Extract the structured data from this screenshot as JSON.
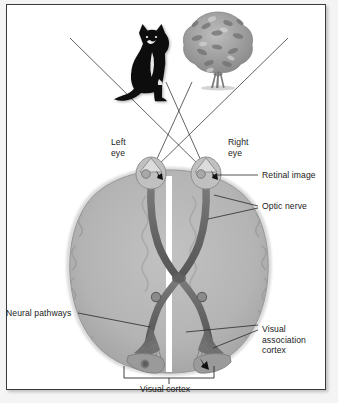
{
  "figure": {
    "type": "anatomical-diagram",
    "background_color": "#ffffff",
    "frame_color": "#3a3a3a",
    "brain_fill": "#b3b3b3",
    "brain_outline": "#8f8f8f",
    "nerve_color": "#6e6e6e",
    "line_color": "#2a2a2a"
  },
  "stimuli": [
    {
      "name": "cat",
      "label": "cat-silhouette",
      "x": 142,
      "y": 57
    },
    {
      "name": "bush",
      "label": "bush-shrub",
      "x": 216,
      "y": 52
    }
  ],
  "labels": {
    "left_eye": "Left\neye",
    "right_eye": "Right\neye",
    "retinal_image": "Retinal image",
    "optic_nerve": "Optic nerve",
    "neural_pathways": "Neural pathways",
    "visual_association_cortex": "Visual\nassociation\ncortex",
    "visual_cortex": "Visual cortex"
  },
  "structures": [
    {
      "name": "left-eye",
      "description": "Left eyeball with inverted retinal image"
    },
    {
      "name": "right-eye",
      "description": "Right eyeball with inverted retinal image"
    },
    {
      "name": "optic-chiasm",
      "description": "X-shaped crossing of optic nerves"
    },
    {
      "name": "lateral-geniculate-nucleus",
      "description": "Relay bump on optic tract"
    },
    {
      "name": "optic-radiation",
      "description": "Fan of fibers to visual cortex"
    },
    {
      "name": "visual-cortex",
      "description": "Occipital cortex receiving visual input"
    }
  ],
  "sight_lines": [
    {
      "from": "cat",
      "to": "right-eye"
    },
    {
      "from": "cat",
      "to": "left-eye"
    },
    {
      "from": "bush",
      "to": "left-eye"
    },
    {
      "from": "bush",
      "to": "right-eye"
    }
  ]
}
